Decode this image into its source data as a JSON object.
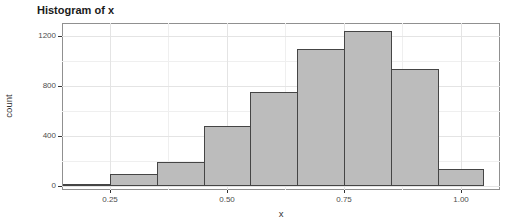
{
  "chart_data": {
    "type": "bar",
    "subtype": "histogram",
    "title": "Histogram of x",
    "xlabel": "x",
    "ylabel": "count",
    "bin_edges": [
      0.15,
      0.25,
      0.35,
      0.45,
      0.55,
      0.65,
      0.75,
      0.85,
      0.95,
      1.05
    ],
    "counts": [
      20,
      100,
      195,
      480,
      755,
      1100,
      1240,
      940,
      135
    ],
    "x_ticks": [
      0.25,
      0.5,
      0.75,
      1.0
    ],
    "x_tick_labels": [
      "0.25",
      "0.50",
      "0.75",
      "1.00"
    ],
    "x_minor_ticks": [
      0.375,
      0.625,
      0.875
    ],
    "y_ticks": [
      0,
      400,
      800,
      1200
    ],
    "y_tick_labels": [
      "0",
      "400",
      "800",
      "1200"
    ],
    "y_minor_ticks": [
      200,
      600,
      1000
    ],
    "xlim": [
      0.1473,
      1.0833
    ],
    "ylim": [
      -32,
      1304
    ],
    "grid": true,
    "legend": "none"
  },
  "colors": {
    "bar_fill": "#bcbcbc",
    "bar_border": "#454545",
    "panel_border": "#909090",
    "grid_major": "#e4e4e4",
    "grid_minor": "#efefef",
    "axis_text": "#4d4d4d",
    "tick_mark": "#333333",
    "title_text": "#1a1a1a",
    "background": "#ffffff"
  }
}
